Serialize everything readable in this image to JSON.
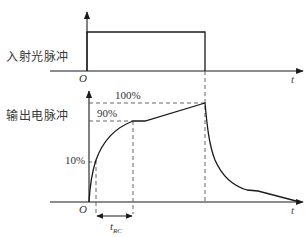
{
  "figure": {
    "cropped_heading_fragment": "",
    "top_panel": {
      "label": "入射光脉冲",
      "origin_label": "O",
      "time_axis_label": "t"
    },
    "bottom_panel": {
      "label": "输出电脉冲",
      "origin_label": "O",
      "time_axis_label": "t",
      "levels": {
        "level_100": "100%",
        "level_90": "90%",
        "level_10": "10%"
      },
      "rise_time_label": "t",
      "rise_time_subscript": "RC"
    },
    "colors": {
      "line": "#1a1a1a",
      "dashed": "#555555",
      "background": "#ffffff"
    }
  }
}
